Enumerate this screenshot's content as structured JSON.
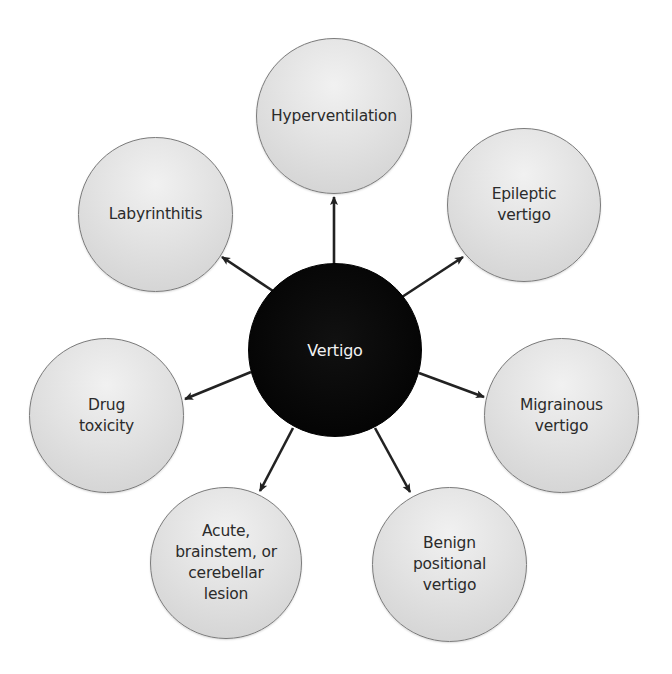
{
  "diagram": {
    "type": "hub-and-spoke",
    "colors": {
      "center_fill": "#000000",
      "center_text": "#f2f2f2",
      "outer_fill": "#e2e2e2",
      "outer_border": "#7a7a7a",
      "outer_text": "#2b2b2b",
      "arrow": "#222222"
    },
    "center": {
      "label": "Vertigo"
    },
    "nodes": [
      {
        "label": "Hyperventilation"
      },
      {
        "label": "Epileptic\nvertigo"
      },
      {
        "label": "Migrainous\nvertigo"
      },
      {
        "label": "Benign\npositional\nvertigo"
      },
      {
        "label": "Acute,\nbrainstem, or\ncerebellar\nlesion"
      },
      {
        "label": "Drug\ntoxicity"
      },
      {
        "label": "Labyrinthitis"
      }
    ],
    "edges": [
      {
        "from": "Vertigo",
        "to": "Hyperventilation"
      },
      {
        "from": "Vertigo",
        "to": "Epileptic vertigo"
      },
      {
        "from": "Vertigo",
        "to": "Migrainous vertigo"
      },
      {
        "from": "Vertigo",
        "to": "Benign positional vertigo"
      },
      {
        "from": "Vertigo",
        "to": "Acute, brainstem, or cerebellar lesion"
      },
      {
        "from": "Vertigo",
        "to": "Drug toxicity"
      },
      {
        "from": "Vertigo",
        "to": "Labyrinthitis"
      }
    ]
  }
}
